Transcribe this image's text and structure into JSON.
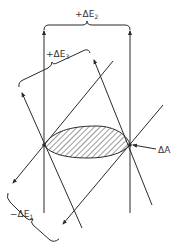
{
  "labels": {
    "dE2": {
      "prefix": "+ΔE",
      "sub": "2"
    },
    "dE3": {
      "prefix": "+ΔE",
      "sub": "3"
    },
    "dE1": {
      "prefix": "−ΔE",
      "sub": "1"
    },
    "dA": "ΔA"
  },
  "colors": {
    "line": "#2a2a2a",
    "hatch": "#3a3a3a",
    "text": "#333333"
  }
}
